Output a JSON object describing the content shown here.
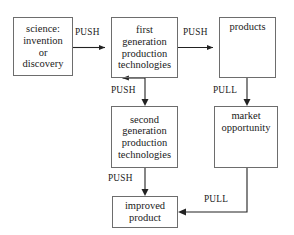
{
  "diagram": {
    "background_color": "#ffffff",
    "box_border_color": "#6d6d6d",
    "line_color": "#222222",
    "text_color": "#1a1a1a",
    "nodes": [
      {
        "id": "science",
        "label_lines": [
          "science:",
          "invention",
          "or",
          "discovery"
        ],
        "x": 13,
        "y": 17,
        "w": 60,
        "h": 59,
        "align": "center"
      },
      {
        "id": "first-generation",
        "label_lines": [
          "first",
          "generation",
          "production",
          "technologies"
        ],
        "x": 111,
        "y": 17,
        "w": 67,
        "h": 61,
        "align": "center"
      },
      {
        "id": "products",
        "label_lines": [
          "products"
        ],
        "x": 219,
        "y": 17,
        "w": 57,
        "h": 61,
        "align": "top"
      },
      {
        "id": "second-generation",
        "label_lines": [
          "second",
          "generation",
          "production",
          "technologies"
        ],
        "x": 111,
        "y": 106,
        "w": 67,
        "h": 62,
        "align": "center"
      },
      {
        "id": "market-opportunity",
        "label_lines": [
          "market",
          "opportunity"
        ],
        "x": 214,
        "y": 106,
        "w": 64,
        "h": 62,
        "align": "top"
      },
      {
        "id": "improved-product",
        "label_lines": [
          "improved",
          "product"
        ],
        "x": 112,
        "y": 196,
        "w": 66,
        "h": 32,
        "align": "center"
      }
    ],
    "edges": [
      {
        "id": "science-to-first-generation",
        "from": "science",
        "to": "first-generation",
        "label": "PUSH",
        "label_x": 75,
        "label_y": 27,
        "kind": "horizontal-right"
      },
      {
        "id": "first-generation-to-products",
        "from": "first-generation",
        "to": "products",
        "label": "PUSH",
        "label_x": 183,
        "label_y": 27,
        "kind": "horizontal-right"
      },
      {
        "id": "first-generation-to-second-generation",
        "from": "first-generation",
        "to": "second-generation",
        "label": "PUSH",
        "label_x": 111,
        "label_y": 85,
        "kind": "vertical-down"
      },
      {
        "id": "products-to-market-opportunity",
        "from": "products",
        "to": "market-opportunity",
        "label": "PULL",
        "label_x": 213,
        "label_y": 85,
        "kind": "vertical-down"
      },
      {
        "id": "second-generation-to-improved-product",
        "from": "second-generation",
        "to": "improved-product",
        "label": "PUSH",
        "label_x": 108,
        "label_y": 173,
        "kind": "vertical-down"
      },
      {
        "id": "market-opportunity-to-improved-product",
        "from": "market-opportunity",
        "to": "improved-product",
        "label": "PULL",
        "label_x": 204,
        "label_y": 194,
        "kind": "elbow-left"
      }
    ]
  }
}
